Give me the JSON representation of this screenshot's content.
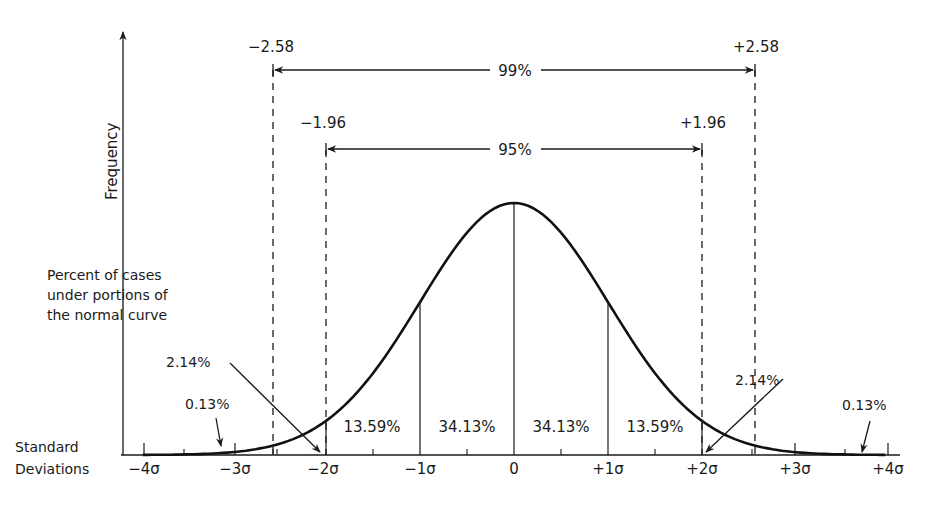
{
  "labels": {
    "y_axis": "Frequency",
    "percent_caption_1": "Percent of cases",
    "percent_caption_2": "under portions of",
    "percent_caption_3": "the normal curve",
    "sd_caption_1": "Standard",
    "sd_caption_2": "Deviations",
    "z99_left": "−2.58",
    "z99_right": "+2.58",
    "span99": "99%",
    "z95_left": "−1.96",
    "z95_right": "+1.96",
    "span95": "95%"
  },
  "regions": {
    "left_tail": "0.13%",
    "left_2_3": "2.14%",
    "left_1_2": "13.59%",
    "left_0_1": "34.13%",
    "right_0_1": "34.13%",
    "right_1_2": "13.59%",
    "right_2_3": "2.14%",
    "right_tail": "0.13%"
  },
  "ticks": [
    "−4σ",
    "−3σ",
    "−2σ",
    "−1σ",
    "0",
    "+1σ",
    "+2σ",
    "+3σ",
    "+4σ"
  ],
  "chart_data": {
    "type": "area",
    "title": "",
    "xlabel": "Standard Deviations",
    "ylabel": "Frequency",
    "x_range": [
      -4,
      4
    ],
    "categories": [
      "-4σ",
      "-3σ",
      "-2σ",
      "-1σ",
      "0",
      "+1σ",
      "+2σ",
      "+3σ",
      "+4σ"
    ],
    "region_percentages": [
      {
        "from": -4,
        "to": -3,
        "percent": 0.13
      },
      {
        "from": -3,
        "to": -2,
        "percent": 2.14
      },
      {
        "from": -2,
        "to": -1,
        "percent": 13.59
      },
      {
        "from": -1,
        "to": 0,
        "percent": 34.13
      },
      {
        "from": 0,
        "to": 1,
        "percent": 34.13
      },
      {
        "from": 1,
        "to": 2,
        "percent": 13.59
      },
      {
        "from": 2,
        "to": 3,
        "percent": 2.14
      },
      {
        "from": 3,
        "to": 4,
        "percent": 0.13
      }
    ],
    "intervals": [
      {
        "label": "95%",
        "from": -1.96,
        "to": 1.96
      },
      {
        "label": "99%",
        "from": -2.58,
        "to": 2.58
      }
    ]
  }
}
